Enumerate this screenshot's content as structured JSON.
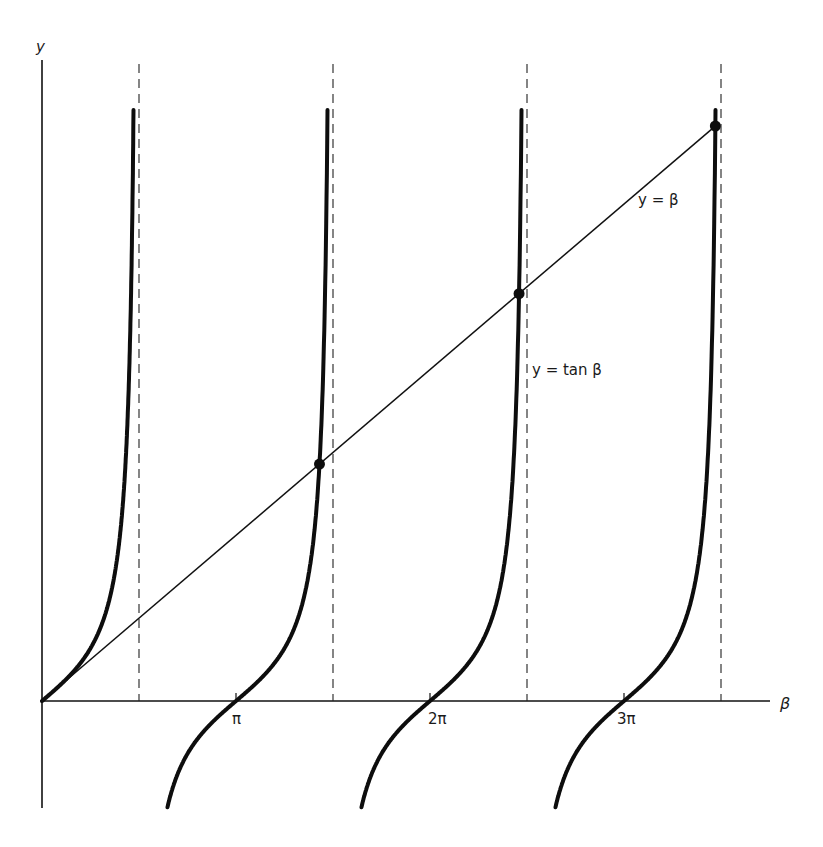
{
  "chart_data": {
    "type": "line",
    "title": "",
    "xlabel": "β",
    "ylabel": "y",
    "x_ticks": [
      {
        "value": 3.14159,
        "label": "π"
      },
      {
        "value": 6.28318,
        "label": "2π"
      },
      {
        "value": 9.42478,
        "label": "3π"
      }
    ],
    "asymptotes": [
      1.5708,
      4.7124,
      7.854,
      10.9956
    ],
    "xlim": [
      0,
      11.5
    ],
    "series": [
      {
        "name": "y = tan β",
        "function": "tan",
        "style": "thick",
        "label_pos": [
          8.0,
          4.4
        ]
      },
      {
        "name": "y = β",
        "function": "identity",
        "style": "thin",
        "label_pos": [
          9.55,
          8.7
        ]
      }
    ],
    "intersections": [
      {
        "beta": 4.4934,
        "y": 4.4934
      },
      {
        "beta": 7.7253,
        "y": 7.7253
      },
      {
        "beta": 10.9041,
        "y": 10.9041
      }
    ],
    "grid": false,
    "legend": "none"
  },
  "labels": {
    "y_axis": "y",
    "x_axis": "β",
    "tan_curve": "y = tan β",
    "line": "y = β",
    "pi": "π",
    "two_pi": "2π",
    "three_pi": "3π"
  }
}
